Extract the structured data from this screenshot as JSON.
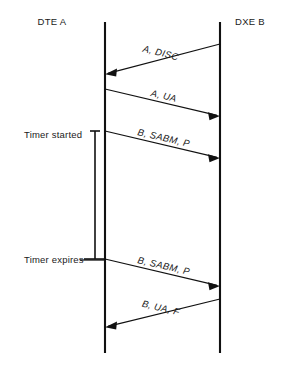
{
  "diagram": {
    "type": "sequence-diagram",
    "background_color": "#ffffff",
    "line_color": "#111111",
    "text_color": "#1a1a1a"
  },
  "lifelines": [
    {
      "id": "dte-a",
      "header": "DTE A",
      "header_x": 52,
      "header_y": 25,
      "x": 105,
      "y_top": 22,
      "y_bottom": 353
    },
    {
      "id": "dxe-b",
      "header": "DXE B",
      "header_x": 250,
      "header_y": 25,
      "x": 220,
      "y_top": 22,
      "y_bottom": 353
    }
  ],
  "messages": [
    {
      "id": "msg-a-disc",
      "label": "A, DISC",
      "direction": "right-to-left",
      "from": "dxe-b",
      "to": "dte-a",
      "x_start": 220,
      "y_start": 44,
      "x_end": 105,
      "y_end": 74,
      "label_x": 160,
      "label_y": 55
    },
    {
      "id": "msg-a-ua",
      "label": "A, UA",
      "direction": "left-to-right",
      "from": "dte-a",
      "to": "dxe-b",
      "x_start": 105,
      "y_start": 89,
      "x_end": 220,
      "y_end": 116,
      "label_x": 163,
      "label_y": 99
    },
    {
      "id": "msg-b-sabm-p-1",
      "label": "B, SABM, P",
      "direction": "left-to-right",
      "from": "dte-a",
      "to": "dxe-b",
      "x_start": 105,
      "y_start": 131,
      "x_end": 220,
      "y_end": 158,
      "label_x": 163,
      "label_y": 141
    },
    {
      "id": "msg-b-sabm-p-2",
      "label": "B, SABM, P",
      "direction": "left-to-right",
      "from": "dte-a",
      "to": "dxe-b",
      "x_start": 105,
      "y_start": 259,
      "x_end": 220,
      "y_end": 286,
      "label_x": 163,
      "label_y": 269
    },
    {
      "id": "msg-b-ua-f",
      "label": "B, UA, F",
      "direction": "right-to-left",
      "from": "dxe-b",
      "to": "dte-a",
      "x_start": 220,
      "y_start": 299,
      "x_end": 105,
      "y_end": 327,
      "label_x": 160,
      "label_y": 310
    }
  ],
  "annotations": [
    {
      "id": "timer-started",
      "label": "Timer started",
      "label_x": 24,
      "label_y": 138
    },
    {
      "id": "timer-expires",
      "label": "Timer expires",
      "label_x": 24,
      "label_y": 263
    }
  ],
  "timer": {
    "id": "timer-bar",
    "x": 95,
    "y_top": 131,
    "y_bottom": 259,
    "tick_top_x1": 90,
    "tick_top_x2": 100,
    "tick_bottom_x1": 84,
    "tick_bottom_x2": 106,
    "leader_x1": 80,
    "leader_x2": 105,
    "leader_y": 260
  }
}
